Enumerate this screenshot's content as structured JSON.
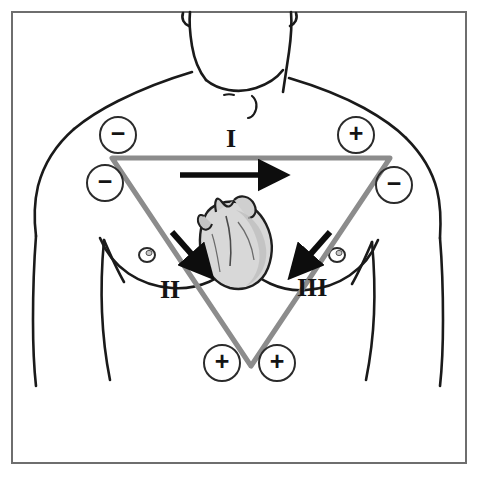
{
  "figure": {
    "border_color": "#6e6e6e",
    "background_color": "#ffffff"
  },
  "diagram": {
    "type": "anatomical-schematic",
    "body_outline_color": "#1a1a1a",
    "triangle": {
      "name": "einthovens-triangle",
      "color": "#8c8c8c",
      "stroke_width": 5,
      "vertices": [
        {
          "id": "right-arm",
          "x": 112,
          "y": 158
        },
        {
          "id": "left-arm",
          "x": 390,
          "y": 158
        },
        {
          "id": "left-leg",
          "x": 251,
          "y": 366
        }
      ]
    },
    "heart": {
      "name": "heart-illustration",
      "fill": "#d2d2d2",
      "outline": "#1f1f1f",
      "center_x": 232,
      "center_y": 243
    }
  },
  "leads": [
    {
      "id": "lead-1",
      "label": "I",
      "label_x": 226,
      "label_y": 126,
      "arrow": {
        "x1": 180,
        "y1": 175,
        "x2": 288,
        "y2": 175,
        "direction": "right"
      }
    },
    {
      "id": "lead-2",
      "label": "II",
      "label_x": 160,
      "label_y": 277,
      "arrow": {
        "x1": 172,
        "y1": 232,
        "x2": 213,
        "y2": 278,
        "direction": "down-right"
      }
    },
    {
      "id": "lead-3",
      "label": "III",
      "label_x": 297,
      "label_y": 275,
      "arrow": {
        "x1": 330,
        "y1": 232,
        "x2": 289,
        "y2": 278,
        "direction": "down-left"
      }
    }
  ],
  "electrodes": [
    {
      "id": "electrode-right-arm-upper",
      "polarity": "−",
      "x": 99,
      "y": 116,
      "position": "right-shoulder"
    },
    {
      "id": "electrode-right-arm-lower",
      "polarity": "−",
      "x": 86,
      "y": 164,
      "position": "right-arm"
    },
    {
      "id": "electrode-left-arm-upper",
      "polarity": "+",
      "x": 337,
      "y": 116,
      "position": "left-shoulder"
    },
    {
      "id": "electrode-left-arm-lower",
      "polarity": "−",
      "x": 375,
      "y": 166,
      "position": "left-arm"
    },
    {
      "id": "electrode-leg-left",
      "polarity": "+",
      "x": 203,
      "y": 344,
      "position": "lower-left-abdomen"
    },
    {
      "id": "electrode-leg-right",
      "polarity": "+",
      "x": 258,
      "y": 344,
      "position": "lower-right-abdomen"
    }
  ]
}
